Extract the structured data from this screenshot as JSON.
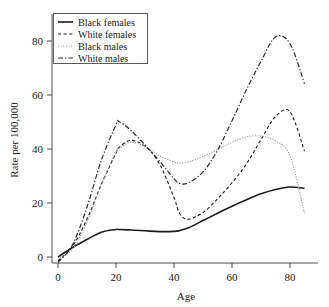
{
  "figure": {
    "background": "#ffffff",
    "frame_color": "#4d4d4d"
  },
  "chart_data": {
    "type": "line",
    "title": "",
    "xlabel": "Age",
    "ylabel": "Rate per 100,000",
    "xlim": [
      -2,
      88
    ],
    "ylim": [
      -4,
      88
    ],
    "xticks": [
      0,
      20,
      40,
      60,
      80
    ],
    "yticks": [
      0,
      20,
      40,
      60,
      80
    ],
    "xticklabels": [
      "0",
      "20",
      "40",
      "60",
      "80"
    ],
    "yticklabels": [
      "0",
      "20",
      "40",
      "60",
      "80"
    ],
    "grid": false,
    "legend_position": "upper left",
    "x": [
      0,
      5,
      10,
      15,
      20,
      21,
      25,
      30,
      35,
      40,
      42,
      45,
      50,
      55,
      60,
      65,
      70,
      75,
      80,
      85
    ],
    "series": [
      {
        "name": "Black females",
        "linestyle": "solid",
        "color": "#1a1a1a",
        "width": 1.6,
        "dash": "none",
        "values": [
          0,
          3.5,
          6.5,
          9.2,
          10.2,
          10.2,
          10.0,
          9.7,
          9.4,
          9.5,
          9.8,
          10.8,
          13.5,
          16.2,
          18.8,
          21.2,
          23.4,
          25.0,
          25.9,
          25.4
        ]
      },
      {
        "name": "White females",
        "linestyle": "dashed",
        "color": "#1a1a1a",
        "width": 1.1,
        "dash": "3.2,2.4",
        "values": [
          -1.5,
          4.0,
          14.0,
          27.0,
          38.5,
          40.5,
          43.2,
          41.0,
          34.5,
          22.0,
          16.0,
          14.0,
          16.5,
          21.5,
          27.5,
          34.5,
          43.5,
          52.0,
          53.8,
          39.2
        ]
      },
      {
        "name": "Black males",
        "linestyle": "dotted",
        "color": "#9a9a9a",
        "width": 1.2,
        "dash": "1.1,1.5",
        "values": [
          -1.0,
          3.0,
          13.0,
          27.0,
          39.0,
          40.0,
          42.5,
          41.0,
          37.5,
          35.2,
          34.8,
          35.2,
          37.2,
          39.8,
          42.5,
          44.5,
          44.8,
          43.0,
          37.5,
          16.0
        ]
      },
      {
        "name": "White males",
        "linestyle": "dashdot",
        "color": "#2a2a2a",
        "width": 1.2,
        "dash": "5,2,1.3,2",
        "values": [
          -2.0,
          4.5,
          18.5,
          36.0,
          49.0,
          50.2,
          47.0,
          41.5,
          35.5,
          29.0,
          27.2,
          27.5,
          31.5,
          39.5,
          50.5,
          62.0,
          72.5,
          81.5,
          79.0,
          64.2
        ]
      }
    ]
  },
  "legend": {
    "entries": [
      {
        "label": "Black females",
        "swatch": "solid-line-swatch"
      },
      {
        "label": "White females",
        "swatch": "dashed-line-swatch"
      },
      {
        "label": "Black males",
        "swatch": "dotted-line-swatch"
      },
      {
        "label": "White males",
        "swatch": "dashdot-line-swatch"
      }
    ]
  }
}
